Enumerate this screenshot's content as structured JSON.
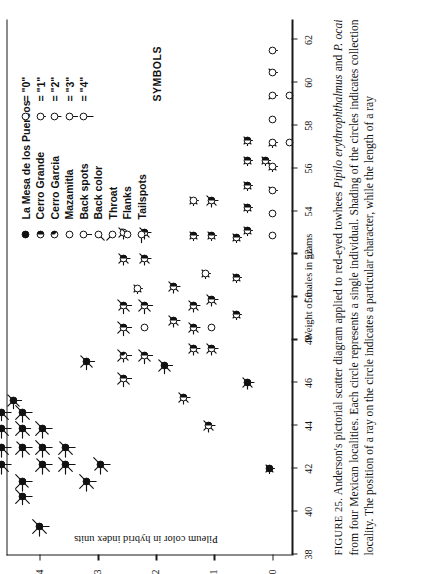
{
  "figure": {
    "number_label": "FIGURE 25.",
    "caption": "Anderson's pictorial scatter diagram applied to red-eyed towhees Pipilo erythrophthalmus and P. ocai from four Mexican localities. Each circle represents a single individual. Shading of the circles indicates collection locality. The position of a ray on the circle indicates a particular character, while the length of a ray",
    "caption_parts": {
      "p1": "Anderson's pictorial scatter diagram applied to red-eyed towhees ",
      "i1": "Pipilo erythrophthalmus",
      "p2": " and ",
      "i2": "P. ocai",
      "p3": " from four Mexican localities. Each circle represents a single individual. Shading of the circles indicates collection locality. The position of a ray on the circle indicates a particular character, while the length of a ray"
    }
  },
  "legend": {
    "title": "SYMBOLS",
    "localities": [
      {
        "label": "La Mesa de los Puercos",
        "symbol": "filled-circle"
      },
      {
        "label": "Cerro Grande",
        "symbol": "half-filled-circle"
      },
      {
        "label": "Cerro Garcia",
        "symbol": "quarter-filled-circle"
      },
      {
        "label": "Mazamitla",
        "symbol": "open-circle"
      }
    ],
    "characters": [
      {
        "label": "Back spots",
        "symbol": "circle-ray-s",
        "ray": "S"
      },
      {
        "label": "Back color",
        "symbol": "circle-ray-sw",
        "ray": "SW"
      },
      {
        "label": "Throat",
        "symbol": "circle-ray-nw",
        "ray": "NW"
      },
      {
        "label": "Flanks",
        "symbol": "circle-ray-ne",
        "ray": "NE"
      },
      {
        "label": "Tailspots",
        "symbol": "circle-ray-w",
        "ray": "W"
      }
    ],
    "values": [
      {
        "label": "= \"0\"",
        "length": 0
      },
      {
        "label": "= \"1\"",
        "length": 1
      },
      {
        "label": "= \"2\"",
        "length": 2
      },
      {
        "label": "= \"3\"",
        "length": 3
      },
      {
        "label": "= \"4\"",
        "length": 4
      }
    ],
    "value_prefix_symbol": "circle-with-ray"
  },
  "chart_data": {
    "type": "scatter",
    "title": "",
    "xlabel": "Weight of males in grams",
    "ylabel": "Pileum color in hybrid index units",
    "xlim": [
      38,
      63
    ],
    "ylim": [
      -0.35,
      4.55
    ],
    "xticks": [
      38,
      40,
      42,
      44,
      46,
      48,
      50,
      52,
      54,
      56,
      58,
      60,
      62
    ],
    "yticks": [
      0,
      1,
      2,
      3,
      4
    ],
    "grid": false,
    "legend_position": "top-right",
    "points": [
      {
        "x": 39.3,
        "y": 4.0,
        "shade": "filled",
        "rays": {
          "S": 4,
          "SW": 4,
          "NW": 4,
          "NE": 4,
          "W": 4
        }
      },
      {
        "x": 40.7,
        "y": 4.3,
        "shade": "filled",
        "rays": {
          "S": 4,
          "SW": 4,
          "NW": 4,
          "NE": 4,
          "W": 3
        }
      },
      {
        "x": 41.4,
        "y": 4.3,
        "shade": "filled",
        "rays": {
          "S": 4,
          "SW": 3,
          "NW": 4,
          "NE": 4,
          "W": 4
        }
      },
      {
        "x": 42.2,
        "y": 4.65,
        "shade": "filled",
        "rays": {
          "S": 4,
          "SW": 4,
          "NW": 4,
          "NE": 4,
          "W": 4
        }
      },
      {
        "x": 43.0,
        "y": 4.65,
        "shade": "filled",
        "rays": {
          "S": 4,
          "SW": 4,
          "NW": 3,
          "NE": 4,
          "W": 4
        }
      },
      {
        "x": 43.0,
        "y": 4.3,
        "shade": "filled",
        "rays": {
          "S": 4,
          "SW": 4,
          "NW": 4,
          "NE": 3,
          "W": 4
        }
      },
      {
        "x": 43.9,
        "y": 4.65,
        "shade": "filled",
        "rays": {
          "S": 4,
          "SW": 4,
          "NW": 4,
          "NE": 4,
          "W": 4
        }
      },
      {
        "x": 43.9,
        "y": 4.3,
        "shade": "filled",
        "rays": {
          "S": 3,
          "SW": 4,
          "NW": 4,
          "NE": 4,
          "W": 4
        }
      },
      {
        "x": 44.6,
        "y": 4.65,
        "shade": "filled",
        "rays": {
          "S": 4,
          "SW": 4,
          "NW": 4,
          "NE": 4,
          "W": 3
        }
      },
      {
        "x": 44.6,
        "y": 4.3,
        "shade": "filled",
        "rays": {
          "S": 4,
          "SW": 4,
          "NW": 4,
          "NE": 4,
          "W": 4
        }
      },
      {
        "x": 45.2,
        "y": 4.45,
        "shade": "filled",
        "rays": {
          "S": 3,
          "SW": 3,
          "NW": 3,
          "NE": 3,
          "W": 3
        }
      },
      {
        "x": 42.2,
        "y": 3.95,
        "shade": "filled",
        "rays": {
          "S": 4,
          "SW": 4,
          "NW": 4,
          "NE": 3,
          "W": 4
        }
      },
      {
        "x": 43.0,
        "y": 3.95,
        "shade": "filled",
        "rays": {
          "S": 4,
          "SW": 4,
          "NW": 4,
          "NE": 4,
          "W": 4
        }
      },
      {
        "x": 43.9,
        "y": 3.95,
        "shade": "filled",
        "rays": {
          "S": 4,
          "SW": 3,
          "NW": 4,
          "NE": 4,
          "W": 4
        }
      },
      {
        "x": 42.2,
        "y": 3.55,
        "shade": "filled",
        "rays": {
          "S": 4,
          "SW": 4,
          "NW": 4,
          "NE": 4,
          "W": 4
        }
      },
      {
        "x": 43.0,
        "y": 3.55,
        "shade": "filled",
        "rays": {
          "S": 4,
          "SW": 4,
          "NW": 4,
          "NE": 3,
          "W": 4
        }
      },
      {
        "x": 41.4,
        "y": 3.2,
        "shade": "filled",
        "rays": {
          "S": 4,
          "SW": 4,
          "NW": 4,
          "NE": 4,
          "W": 4
        }
      },
      {
        "x": 42.2,
        "y": 2.95,
        "shade": "filled",
        "rays": {
          "S": 4,
          "SW": 4,
          "NW": 3,
          "NE": 4,
          "W": 4
        }
      },
      {
        "x": 47.0,
        "y": 3.2,
        "shade": "filled",
        "rays": {
          "S": 3,
          "SW": 3,
          "NW": 3,
          "NE": 3,
          "W": 3
        }
      },
      {
        "x": 46.2,
        "y": 2.55,
        "shade": "half",
        "rays": {
          "S": 3,
          "SW": 3,
          "NW": 3,
          "NE": 3,
          "W": 3
        }
      },
      {
        "x": 47.3,
        "y": 2.55,
        "shade": "quarter",
        "rays": {
          "S": 3,
          "SW": 2,
          "NW": 3,
          "NE": 3,
          "W": 2
        }
      },
      {
        "x": 48.6,
        "y": 2.55,
        "shade": "half",
        "rays": {
          "S": 3,
          "SW": 3,
          "NW": 3,
          "NE": 3,
          "W": 3
        }
      },
      {
        "x": 49.6,
        "y": 2.55,
        "shade": "half",
        "rays": {
          "S": 3,
          "SW": 3,
          "NW": 2,
          "NE": 3,
          "W": 3
        }
      },
      {
        "x": 47.3,
        "y": 2.2,
        "shade": "half",
        "rays": {
          "S": 3,
          "SW": 3,
          "NW": 3,
          "NE": 3,
          "W": 3
        }
      },
      {
        "x": 48.6,
        "y": 2.2,
        "shade": "open",
        "rays": {
          "S": 0,
          "SW": 0,
          "NW": 0,
          "NE": 0,
          "W": 0
        }
      },
      {
        "x": 49.6,
        "y": 2.2,
        "shade": "half",
        "rays": {
          "S": 3,
          "SW": 3,
          "NW": 3,
          "NE": 3,
          "W": 3
        }
      },
      {
        "x": 50.4,
        "y": 2.32,
        "shade": "open",
        "rays": {
          "S": 1,
          "SW": 1,
          "NW": 1,
          "NE": 1,
          "W": 1
        }
      },
      {
        "x": 51.8,
        "y": 2.55,
        "shade": "half",
        "rays": {
          "S": 2,
          "SW": 2,
          "NW": 2,
          "NE": 2,
          "W": 2
        }
      },
      {
        "x": 53.0,
        "y": 2.55,
        "shade": "open",
        "rays": {
          "S": 2,
          "SW": 2,
          "NW": 2,
          "NE": 2,
          "W": 2
        }
      },
      {
        "x": 51.8,
        "y": 2.2,
        "shade": "half",
        "rays": {
          "S": 2,
          "SW": 2,
          "NW": 2,
          "NE": 2,
          "W": 2
        }
      },
      {
        "x": 53.0,
        "y": 2.2,
        "shade": "half",
        "rays": {
          "S": 2,
          "SW": 2,
          "NW": 2,
          "NE": 2,
          "W": 2
        }
      },
      {
        "x": 46.8,
        "y": 1.85,
        "shade": "filled",
        "rays": {
          "S": 3,
          "SW": 3,
          "NW": 3,
          "NE": 3,
          "W": 3
        }
      },
      {
        "x": 48.9,
        "y": 1.7,
        "shade": "half",
        "rays": {
          "S": 2,
          "SW": 2,
          "NW": 2,
          "NE": 2,
          "W": 2
        }
      },
      {
        "x": 50.5,
        "y": 1.7,
        "shade": "half",
        "rays": {
          "S": 2,
          "SW": 2,
          "NW": 2,
          "NE": 2,
          "W": 2
        }
      },
      {
        "x": 47.6,
        "y": 1.35,
        "shade": "half",
        "rays": {
          "S": 2,
          "SW": 2,
          "NW": 2,
          "NE": 2,
          "W": 2
        }
      },
      {
        "x": 48.6,
        "y": 1.35,
        "shade": "half",
        "rays": {
          "S": 2,
          "SW": 2,
          "NW": 2,
          "NE": 2,
          "W": 2
        }
      },
      {
        "x": 49.6,
        "y": 1.35,
        "shade": "half",
        "rays": {
          "S": 2,
          "SW": 2,
          "NW": 2,
          "NE": 2,
          "W": 2
        }
      },
      {
        "x": 51.1,
        "y": 1.15,
        "shade": "open",
        "rays": {
          "S": 1,
          "SW": 1,
          "NW": 1,
          "NE": 1,
          "W": 1
        }
      },
      {
        "x": 47.6,
        "y": 1.05,
        "shade": "half",
        "rays": {
          "S": 2,
          "SW": 2,
          "NW": 2,
          "NE": 2,
          "W": 2
        }
      },
      {
        "x": 48.6,
        "y": 1.05,
        "shade": "open",
        "rays": {
          "S": 0,
          "SW": 0,
          "NW": 0,
          "NE": 0,
          "W": 0
        }
      },
      {
        "x": 49.9,
        "y": 1.05,
        "shade": "half",
        "rays": {
          "S": 2,
          "SW": 2,
          "NW": 2,
          "NE": 2,
          "W": 2
        }
      },
      {
        "x": 52.9,
        "y": 1.35,
        "shade": "half",
        "rays": {
          "S": 1,
          "SW": 1,
          "NW": 1,
          "NE": 1,
          "W": 1
        }
      },
      {
        "x": 54.5,
        "y": 1.35,
        "shade": "open",
        "rays": {
          "S": 1,
          "SW": 1,
          "NW": 1,
          "NE": 1,
          "W": 1
        }
      },
      {
        "x": 52.9,
        "y": 1.05,
        "shade": "half",
        "rays": {
          "S": 1,
          "SW": 1,
          "NW": 1,
          "NE": 1,
          "W": 1
        }
      },
      {
        "x": 54.5,
        "y": 1.05,
        "shade": "half",
        "rays": {
          "S": 2,
          "SW": 2,
          "NW": 2,
          "NE": 2,
          "W": 2
        }
      },
      {
        "x": 45.3,
        "y": 1.52,
        "shade": "half",
        "rays": {
          "S": 2,
          "SW": 2,
          "NW": 2,
          "NE": 2,
          "W": 2
        }
      },
      {
        "x": 44.0,
        "y": 1.1,
        "shade": "half",
        "rays": {
          "S": 2,
          "SW": 2,
          "NW": 2,
          "NE": 2,
          "W": 2
        }
      },
      {
        "x": 49.2,
        "y": 0.62,
        "shade": "half",
        "rays": {
          "S": 1,
          "SW": 1,
          "NW": 1,
          "NE": 1,
          "W": 1
        }
      },
      {
        "x": 50.9,
        "y": 0.62,
        "shade": "half",
        "rays": {
          "S": 1,
          "SW": 1,
          "NW": 1,
          "NE": 1,
          "W": 1
        }
      },
      {
        "x": 52.8,
        "y": 0.62,
        "shade": "half",
        "rays": {
          "S": 1,
          "SW": 1,
          "NW": 1,
          "NE": 1,
          "W": 1
        }
      },
      {
        "x": 46.0,
        "y": 0.42,
        "shade": "filled",
        "rays": {
          "S": 2,
          "SW": 2,
          "NW": 2,
          "NE": 2,
          "W": 2
        }
      },
      {
        "x": 53.1,
        "y": 0.42,
        "shade": "half",
        "rays": {
          "S": 1,
          "SW": 1,
          "NW": 1,
          "NE": 1,
          "W": 1
        }
      },
      {
        "x": 54.2,
        "y": 0.42,
        "shade": "half",
        "rays": {
          "S": 1,
          "SW": 1,
          "NW": 1,
          "NE": 1,
          "W": 1
        }
      },
      {
        "x": 55.2,
        "y": 0.42,
        "shade": "half",
        "rays": {
          "S": 1,
          "SW": 1,
          "NW": 1,
          "NE": 1,
          "W": 1
        }
      },
      {
        "x": 56.4,
        "y": 0.42,
        "shade": "half",
        "rays": {
          "S": 1,
          "SW": 1,
          "NW": 1,
          "NE": 1,
          "W": 1
        }
      },
      {
        "x": 57.3,
        "y": 0.42,
        "shade": "half",
        "rays": {
          "S": 1,
          "SW": 1,
          "NW": 1,
          "NE": 1,
          "W": 1
        }
      },
      {
        "x": 56.4,
        "y": 0.12,
        "shade": "half",
        "rays": {
          "S": 1,
          "SW": 1,
          "NW": 1,
          "NE": 1,
          "W": 1
        }
      },
      {
        "x": 42.0,
        "y": 0.05,
        "shade": "filled",
        "rays": {
          "S": 1,
          "SW": 1,
          "NW": 1,
          "NE": 1,
          "W": 1
        }
      },
      {
        "x": 52.9,
        "y": 0.0,
        "shade": "open",
        "rays": {
          "S": 0,
          "SW": 0,
          "NW": 0,
          "NE": 0,
          "W": 0
        }
      },
      {
        "x": 53.9,
        "y": 0.0,
        "shade": "open",
        "rays": {
          "S": 0,
          "SW": 0,
          "NW": 0,
          "NE": 0,
          "W": 0
        }
      },
      {
        "x": 55.0,
        "y": 0.0,
        "shade": "open",
        "rays": {
          "S": 1,
          "SW": 0,
          "NW": 0,
          "NE": 1,
          "W": 0
        }
      },
      {
        "x": 56.1,
        "y": 0.0,
        "shade": "open",
        "rays": {
          "S": 1,
          "SW": 1,
          "NW": 1,
          "NE": 1,
          "W": 1
        }
      },
      {
        "x": 57.2,
        "y": 0.0,
        "shade": "open",
        "rays": {
          "S": 1,
          "SW": 1,
          "NW": 1,
          "NE": 0,
          "W": 1
        }
      },
      {
        "x": 58.3,
        "y": 0.0,
        "shade": "open",
        "rays": {
          "S": 0,
          "SW": 0,
          "NW": 0,
          "NE": 0,
          "W": 0
        }
      },
      {
        "x": 59.4,
        "y": 0.0,
        "shade": "open",
        "rays": {
          "S": 1,
          "SW": 0,
          "NW": 1,
          "NE": 0,
          "W": 0
        }
      },
      {
        "x": 60.5,
        "y": 0.0,
        "shade": "open",
        "rays": {
          "S": 1,
          "SW": 0,
          "NW": 0,
          "NE": 1,
          "W": 0
        }
      },
      {
        "x": 61.5,
        "y": 0.0,
        "shade": "open",
        "rays": {
          "S": 1,
          "SW": 0,
          "NW": 0,
          "NE": 0,
          "W": 0
        }
      },
      {
        "x": 57.2,
        "y": -0.3,
        "shade": "open",
        "rays": {
          "S": 0,
          "SW": 0,
          "NW": 0,
          "NE": 0,
          "W": 0
        }
      },
      {
        "x": 59.4,
        "y": -0.3,
        "shade": "open",
        "rays": {
          "S": 0,
          "SW": 0,
          "NW": 0,
          "NE": 0,
          "W": 0
        }
      }
    ]
  }
}
